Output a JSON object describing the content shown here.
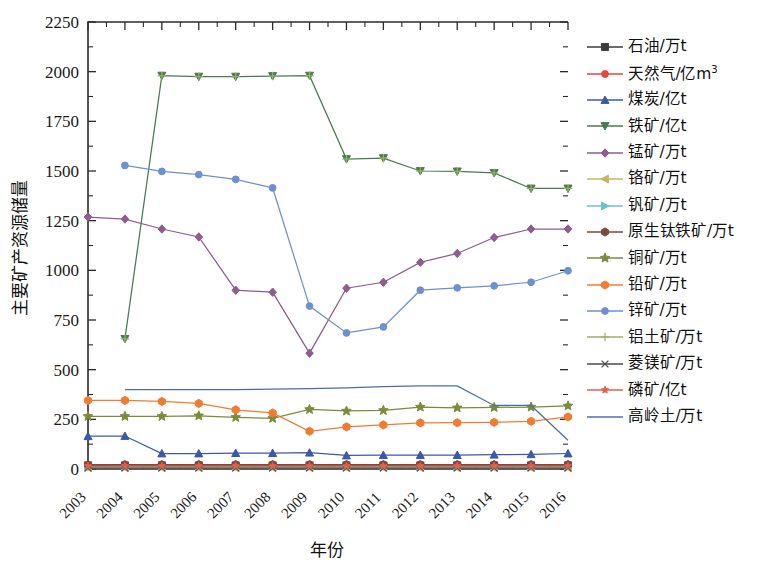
{
  "chart_data": {
    "type": "line",
    "title": "",
    "xlabel": "年份",
    "ylabel": "主要矿产资源储量",
    "x": [
      2003,
      2004,
      2005,
      2006,
      2007,
      2008,
      2009,
      2010,
      2011,
      2012,
      2013,
      2014,
      2015,
      2016
    ],
    "xtick_labels": [
      "2003",
      "2004",
      "2005",
      "2006",
      "2007",
      "2008",
      "2009",
      "2010",
      "2011",
      "2012",
      "2013",
      "2014",
      "2015",
      "2016"
    ],
    "ytick_labels": [
      "0",
      "250",
      "500",
      "750",
      "1000",
      "1250",
      "1500",
      "1750",
      "2000",
      "2250"
    ],
    "ylim": [
      0,
      2250
    ],
    "ytick_step": 250,
    "grid": false,
    "legend_position": "right",
    "series": [
      {
        "name": "石油/万t",
        "color": "#3b3b3b",
        "marker": "square",
        "values": [
          18,
          18,
          18,
          18,
          18,
          18,
          18,
          18,
          18,
          18,
          18,
          18,
          18,
          18
        ]
      },
      {
        "name": "天然气/亿m³",
        "color": "#e8443a",
        "marker": "circle",
        "values": [
          12,
          14,
          14,
          14,
          14,
          14,
          14,
          14,
          14,
          14,
          14,
          14,
          14,
          14
        ]
      },
      {
        "name": "煤炭/亿t",
        "color": "#3a5aa8",
        "marker": "triangle",
        "values": [
          165,
          166,
          78,
          78,
          80,
          80,
          82,
          68,
          70,
          70,
          70,
          72,
          74,
          78
        ]
      },
      {
        "name": "铁矿/亿t",
        "color": "#4a7a52",
        "marker": "triangle-down",
        "values": [
          null,
          655,
          1980,
          1975,
          1975,
          1978,
          1980,
          1560,
          1565,
          1500,
          1498,
          1490,
          1412,
          1412
        ]
      },
      {
        "name": "锰矿/万t",
        "color": "#8e5d8e",
        "marker": "diamond",
        "values": [
          1268,
          1258,
          1208,
          1168,
          900,
          890,
          583,
          910,
          940,
          1040,
          1085,
          1165,
          1208,
          1208
        ]
      },
      {
        "name": "铬矿/万t",
        "color": "#c9b464",
        "marker": "triangle-left",
        "values": [
          6,
          6,
          6,
          6,
          6,
          6,
          6,
          6,
          6,
          6,
          6,
          6,
          6,
          6
        ]
      },
      {
        "name": "钒矿/万t",
        "color": "#6fc2c8",
        "marker": "triangle-right",
        "values": [
          9,
          9,
          9,
          9,
          9,
          9,
          9,
          9,
          9,
          9,
          9,
          9,
          9,
          9
        ]
      },
      {
        "name": "原生钛铁矿/万t",
        "color": "#7a4a3a",
        "marker": "hexagon",
        "values": [
          22,
          22,
          22,
          22,
          22,
          22,
          22,
          22,
          22,
          22,
          22,
          22,
          22,
          22
        ]
      },
      {
        "name": "铜矿/万t",
        "color": "#7c8a3c",
        "marker": "star",
        "values": [
          265,
          265,
          265,
          268,
          260,
          255,
          300,
          292,
          295,
          312,
          308,
          310,
          312,
          318
        ]
      },
      {
        "name": "铅矿/万t",
        "color": "#f07c32",
        "marker": "hexagon",
        "values": [
          345,
          345,
          340,
          330,
          298,
          282,
          190,
          212,
          222,
          232,
          233,
          235,
          240,
          262
        ]
      },
      {
        "name": "锌矿/万t",
        "color": "#6f90cc",
        "marker": "circle",
        "values": [
          null,
          1528,
          1498,
          1482,
          1458,
          1415,
          820,
          685,
          715,
          900,
          912,
          922,
          940,
          998
        ]
      },
      {
        "name": "铝土矿/万t",
        "color": "#9bb06a",
        "marker": "plus",
        "values": [
          null,
          null,
          null,
          null,
          null,
          null,
          null,
          null,
          null,
          null,
          null,
          null,
          null,
          null
        ]
      },
      {
        "name": "菱镁矿/万t",
        "color": "#4a4a4a",
        "marker": "x",
        "values": [
          5,
          5,
          5,
          5,
          5,
          5,
          5,
          5,
          5,
          5,
          5,
          5,
          5,
          5
        ]
      },
      {
        "name": "磷矿/亿t",
        "color": "#e0614f",
        "marker": "star-small",
        "values": [
          15,
          15,
          15,
          15,
          15,
          15,
          15,
          15,
          15,
          15,
          15,
          15,
          15,
          15
        ]
      },
      {
        "name": "高岭土/万t",
        "color": "#4a6fa8",
        "marker": "none",
        "values": [
          null,
          400,
          400,
          400,
          400,
          402,
          405,
          408,
          415,
          418,
          418,
          320,
          320,
          145
        ]
      }
    ]
  }
}
